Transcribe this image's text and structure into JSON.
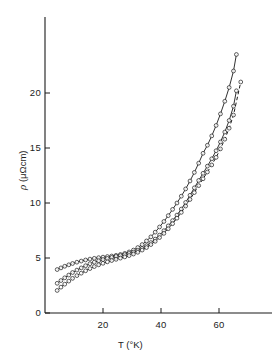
{
  "figure": {
    "background_color": "#ffffff",
    "ink_color": "#1a1a1a"
  },
  "axes": {
    "x_title": "T (°K)",
    "y_title_rho": "ρ",
    "y_title_units": "(μΩcm)",
    "x_ticks": [
      "20",
      "40",
      "60"
    ],
    "y_ticks": [
      "0",
      "5",
      "10",
      "15",
      "20"
    ]
  },
  "chart_data": {
    "type": "line",
    "title": "",
    "subtitle": "",
    "xlabel": "T (°K)",
    "ylabel": "ρ (μΩcm)",
    "xlim": [
      0,
      70
    ],
    "ylim": [
      0,
      24
    ],
    "xticks": [
      20,
      40,
      60
    ],
    "yticks": [
      0,
      5,
      10,
      15,
      20
    ],
    "grid": false,
    "legend": "none",
    "marker": "open-circle",
    "annotations": [],
    "series": [
      {
        "name": "sample-1",
        "line_style": "solid",
        "marker": "open-circle",
        "x": [
          4.2,
          5.5,
          6.8,
          8.2,
          9.5,
          11.0,
          12.5,
          14.0,
          15.5,
          17.0,
          18.5,
          20.0,
          21.5,
          23.0,
          24.5,
          26.0,
          27.5,
          29.0,
          30.5,
          32.0,
          33.5,
          35.0,
          36.5,
          38.0,
          39.5,
          41.0,
          42.5,
          44.0,
          45.5,
          47.0,
          48.5,
          50.0,
          51.5,
          53.0,
          54.5,
          56.0,
          57.5,
          59.0,
          60.5,
          62.0,
          63.5,
          65.0,
          66.0
        ],
        "y": [
          3.95,
          4.1,
          4.25,
          4.38,
          4.5,
          4.62,
          4.72,
          4.82,
          4.9,
          4.97,
          5.03,
          5.08,
          5.13,
          5.18,
          5.24,
          5.32,
          5.42,
          5.55,
          5.72,
          5.95,
          6.22,
          6.55,
          6.92,
          7.35,
          7.82,
          8.32,
          8.85,
          9.42,
          10.0,
          10.62,
          11.28,
          12.0,
          12.78,
          13.62,
          14.52,
          15.25,
          16.1,
          17.05,
          18.1,
          19.25,
          20.5,
          22.0,
          23.5
        ]
      },
      {
        "name": "sample-2",
        "line_style": "solid",
        "marker": "open-circle",
        "x": [
          4.2,
          5.5,
          6.8,
          8.2,
          9.5,
          11.0,
          12.5,
          14.0,
          15.5,
          17.0,
          18.5,
          20.0,
          21.5,
          23.0,
          24.5,
          26.0,
          27.5,
          29.0,
          30.5,
          32.0,
          33.5,
          35.0,
          36.5,
          38.0,
          39.5,
          41.0,
          42.5,
          44.0,
          45.5,
          47.0,
          48.5,
          50.0,
          51.5,
          53.0,
          54.5,
          56.0,
          57.5,
          59.0,
          60.5,
          62.0,
          63.5,
          65.0,
          66.0
        ],
        "y": [
          2.7,
          2.95,
          3.2,
          3.45,
          3.68,
          3.9,
          4.1,
          4.3,
          4.48,
          4.62,
          4.75,
          4.86,
          4.96,
          5.05,
          5.14,
          5.22,
          5.31,
          5.41,
          5.53,
          5.68,
          5.88,
          6.12,
          6.4,
          6.72,
          7.08,
          7.48,
          7.92,
          8.4,
          8.9,
          9.45,
          10.05,
          10.7,
          11.38,
          12.05,
          12.7,
          13.35,
          14.02,
          14.75,
          15.55,
          16.45,
          17.5,
          18.8,
          20.2
        ]
      },
      {
        "name": "sample-3",
        "line_style": "dashed",
        "marker": "open-circle",
        "x": [
          4.2,
          5.5,
          6.8,
          8.2,
          9.5,
          11.0,
          12.5,
          14.0,
          15.5,
          17.0,
          18.5,
          20.0,
          21.5,
          23.0,
          24.5,
          26.0,
          27.5,
          29.0,
          30.5,
          32.0,
          33.5,
          35.0,
          36.5,
          38.0,
          39.5,
          41.0,
          42.5,
          44.0,
          45.5,
          47.0,
          48.5,
          50.0,
          51.5,
          53.0,
          54.5,
          56.0,
          57.5,
          59.0,
          60.5,
          62.0,
          63.5,
          65.0,
          67.5
        ],
        "y": [
          2.05,
          2.35,
          2.62,
          2.9,
          3.15,
          3.4,
          3.62,
          3.84,
          4.04,
          4.22,
          4.38,
          4.52,
          4.65,
          4.77,
          4.88,
          4.99,
          5.1,
          5.22,
          5.36,
          5.52,
          5.72,
          5.95,
          6.22,
          6.52,
          6.86,
          7.24,
          7.66,
          8.12,
          8.62,
          9.15,
          9.72,
          10.32,
          10.95,
          11.58,
          12.2,
          12.82,
          13.46,
          14.15,
          14.92,
          15.8,
          16.8,
          18.0,
          21.0
        ]
      }
    ]
  }
}
